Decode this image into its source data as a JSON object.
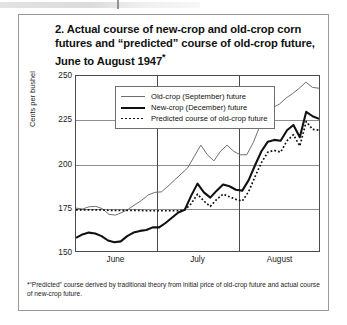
{
  "page": {
    "header_fragment": ""
  },
  "figure": {
    "title_lines": [
      "2. Actual course of new-crop and old-crop corn",
      "futures and “predicted” course of old-crop future,",
      "June to August 1947"
    ],
    "title_marker": "*",
    "footnote": "*“Predicted” course derived by traditional theory from initial price of old-crop future and actual course of new-crop future."
  },
  "legend": {
    "position": "top-left-inside",
    "items": [
      {
        "label": "Old-crop (September) future",
        "style": "thin-solid",
        "color": "#6d6d6d"
      },
      {
        "label": "New-crop (December) future",
        "style": "thick-solid",
        "color": "#111111"
      },
      {
        "label": "Predicted course of old-crop future",
        "style": "dotted",
        "color": "#111111"
      }
    ]
  },
  "chart_data": {
    "type": "line",
    "title": "2. Actual course of new-crop and old-crop corn futures and “predicted” course of old-crop future, June to August 1947*",
    "xlabel": "",
    "ylabel": "Cents per bushel",
    "ylim": [
      150,
      250
    ],
    "yticks": [
      150,
      175,
      200,
      225,
      250
    ],
    "xticks": [
      "June",
      "July",
      "August"
    ],
    "xtick_positions": [
      0.165,
      0.5,
      0.835
    ],
    "x_dividers": [
      0.33,
      0.665
    ],
    "grid": "horizontal",
    "x_index": [
      0,
      1,
      2,
      3,
      4,
      5,
      6,
      7,
      8,
      9,
      10,
      11,
      12,
      13,
      14,
      15,
      16,
      17,
      18,
      19,
      20,
      21,
      22,
      23,
      24,
      25,
      26,
      27,
      28,
      29,
      30,
      31,
      32,
      33,
      34,
      35,
      36
    ],
    "series": [
      {
        "name": "Old-crop (September) future",
        "style": "thin-solid",
        "color": "#6d6d6d",
        "values": [
          174.5,
          174.0,
          175.3,
          175.5,
          174.2,
          171.0,
          170.5,
          172.0,
          174.0,
          176.5,
          179.0,
          182.0,
          183.5,
          183.8,
          187.0,
          190.5,
          194.0,
          197.5,
          204.0,
          210.5,
          205.0,
          201.5,
          207.0,
          210.5,
          207.0,
          205.0,
          205.0,
          212.0,
          221.5,
          230.5,
          232.0,
          234.0,
          237.5,
          240.0,
          243.0,
          246.5,
          243.5,
          243.0
        ]
      },
      {
        "name": "New-crop (December) future",
        "style": "thick-solid",
        "color": "#111111",
        "values": [
          157.5,
          159.5,
          160.5,
          160.0,
          158.5,
          156.0,
          155.0,
          155.5,
          158.5,
          160.5,
          161.5,
          162.0,
          163.5,
          163.5,
          166.0,
          169.0,
          172.0,
          173.5,
          181.5,
          188.5,
          183.5,
          180.5,
          184.5,
          188.0,
          187.0,
          185.0,
          184.5,
          190.5,
          199.0,
          207.0,
          212.5,
          213.5,
          213.0,
          219.0,
          222.0,
          215.0,
          229.5,
          227.0,
          225.5
        ]
      },
      {
        "name": "Predicted course of old-crop future",
        "style": "dotted",
        "color": "#111111",
        "values": [
          173.5,
          173.5,
          173.5,
          173.5,
          173.5,
          173.3,
          173.2,
          173.2,
          173.2,
          173.2,
          173.2,
          173.0,
          173.0,
          173.0,
          173.0,
          173.0,
          173.0,
          173.5,
          177.0,
          182.5,
          178.5,
          175.5,
          179.5,
          182.5,
          181.0,
          179.5,
          178.5,
          184.0,
          192.5,
          200.5,
          206.5,
          207.5,
          206.5,
          213.0,
          216.5,
          210.0,
          224.0,
          219.5,
          219.0
        ]
      }
    ]
  }
}
